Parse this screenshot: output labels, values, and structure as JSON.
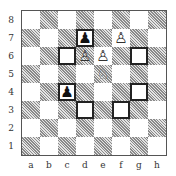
{
  "board": {
    "ranks": [
      "8",
      "7",
      "6",
      "5",
      "4",
      "3",
      "2",
      "1"
    ],
    "files": [
      "a",
      "b",
      "c",
      "d",
      "e",
      "f",
      "g",
      "h"
    ],
    "orientation": "white-bottom",
    "pieces": [
      {
        "square": "d7",
        "color": "black",
        "type": "pawn",
        "glyph": "♟"
      },
      {
        "square": "f7",
        "color": "white",
        "type": "pawn",
        "glyph": "♙"
      },
      {
        "square": "d6",
        "color": "white",
        "type": "pawn",
        "glyph": "♙"
      },
      {
        "square": "e6",
        "color": "white",
        "type": "pawn",
        "glyph": "♙"
      },
      {
        "square": "e5",
        "color": "white",
        "type": "knight",
        "glyph": "♘"
      },
      {
        "square": "c4",
        "color": "black",
        "type": "pawn",
        "glyph": "♟"
      }
    ],
    "highlighted_squares": [
      "d7",
      "c6",
      "g6",
      "c4",
      "g4",
      "d3",
      "f3"
    ],
    "colors": {
      "light": "#ffffff",
      "dark": "#9a9a9a",
      "highlight_border": "#222222"
    }
  }
}
